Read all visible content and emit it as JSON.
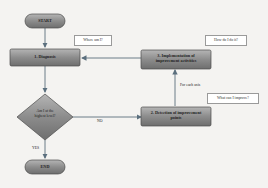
{
  "diagram": {
    "nodes": {
      "start": {
        "label": "START",
        "shape": "terminal"
      },
      "diagnosis": {
        "label": "1. Diagnosis",
        "shape": "process"
      },
      "decision": {
        "label": "Am I at the highest level?",
        "shape": "decision"
      },
      "detection": {
        "label": "2. Detection of improvement points",
        "shape": "process"
      },
      "implementation": {
        "label": "3. Implementation of improvement activities",
        "shape": "process"
      },
      "end": {
        "label": "END",
        "shape": "terminal"
      }
    },
    "callouts": {
      "diagnosis": "Where am I?",
      "implementation": "How do I do it?",
      "detection": "What can I improve?"
    },
    "edge_labels": {
      "no": "NO",
      "yes": "YES",
      "for_each": "For each axis"
    },
    "edges": [
      {
        "from": "start",
        "to": "diagnosis"
      },
      {
        "from": "diagnosis",
        "to": "decision"
      },
      {
        "from": "decision",
        "to": "detection",
        "label": "NO"
      },
      {
        "from": "decision",
        "to": "end",
        "label": "YES"
      },
      {
        "from": "detection",
        "to": "implementation",
        "label": "For each axis"
      },
      {
        "from": "implementation",
        "to": "diagnosis"
      }
    ],
    "colors": {
      "box_fill": "#8a8a8a",
      "box_border": "#4a4a4a",
      "arrow": "#5b6f7e",
      "background": "#f4f3f1"
    }
  }
}
